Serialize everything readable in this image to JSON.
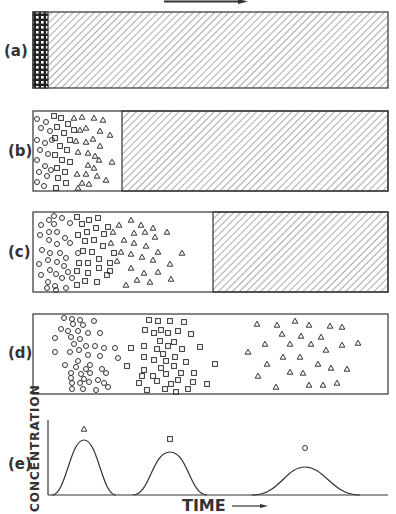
{
  "figure": {
    "flow_arrow": "right-arrow",
    "panels": [
      {
        "label": "(a)",
        "stage": "sample loaded at column inlet",
        "white_fraction_end_x": 48
      },
      {
        "label": "(b)",
        "stage": "components begin to separate",
        "white_fraction_end_x": 122
      },
      {
        "label": "(c)",
        "stage": "further separation",
        "white_fraction_end_x": 213
      },
      {
        "label": "(d)",
        "stage": "components fully separated",
        "white_fraction_end_x": 388
      },
      {
        "label": "(e)",
        "stage": "elution chromatogram"
      }
    ],
    "legend_symbols": [
      "triangle-icon",
      "square-icon",
      "circle-icon"
    ],
    "chromatogram": {
      "ylabel": "CONCENTRATION",
      "xlabel": "TIME",
      "xarrow": "right-arrow",
      "peaks": [
        {
          "symbol": "triangle",
          "center_x": 84,
          "height": 0.78,
          "width": 28
        },
        {
          "symbol": "square",
          "center_x": 170,
          "height": 0.61,
          "width": 32
        },
        {
          "symbol": "circle",
          "center_x": 305,
          "height": 0.4,
          "width": 52
        }
      ]
    }
  }
}
